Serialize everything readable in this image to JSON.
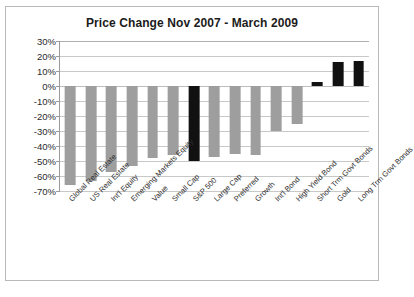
{
  "chart_data": {
    "type": "bar",
    "title": "Price Change Nov 2007 - March 2009",
    "xlabel": "",
    "ylabel": "",
    "ylim": [
      -70,
      30
    ],
    "ytick_step": 10,
    "grid": true,
    "legend": "none",
    "value_suffix": "%",
    "categories": [
      "Global Real Estate",
      "US Real Estate",
      "Int'l Equity",
      "Emerging Markets Equity",
      "Value",
      "Small Cap",
      "S&P 500",
      "Large Cap",
      "Preferred",
      "Growth",
      "Int'l Bond",
      "High Yield Bond",
      "Short Trm Govt Bonds",
      "Gold",
      "Long Trm Govt Bonds"
    ],
    "values": [
      -66,
      -63,
      -57,
      -53,
      -48,
      -46,
      -50,
      -47,
      -45,
      -46,
      -30,
      -25,
      3,
      16,
      17
    ],
    "bar_colors": [
      "#9e9e9e",
      "#9e9e9e",
      "#9e9e9e",
      "#9e9e9e",
      "#9e9e9e",
      "#9e9e9e",
      "#111111",
      "#9e9e9e",
      "#9e9e9e",
      "#9e9e9e",
      "#9e9e9e",
      "#9e9e9e",
      "#111111",
      "#111111",
      "#111111"
    ],
    "ytick_labels": [
      "30%",
      "20%",
      "10%",
      "0%",
      "-10%",
      "-20%",
      "-30%",
      "-40%",
      "-50%",
      "-60%",
      "-70%"
    ],
    "ytick_values": [
      30,
      20,
      10,
      0,
      -10,
      -20,
      -30,
      -40,
      -50,
      -60,
      -70
    ],
    "colors": {
      "negative_bar": "#9e9e9e",
      "highlight_bar": "#111111",
      "gridline": "#c8c8c8",
      "axis": "#9a9a9a",
      "frame": "#b9b9b9",
      "text": "#1b1b1b"
    }
  }
}
